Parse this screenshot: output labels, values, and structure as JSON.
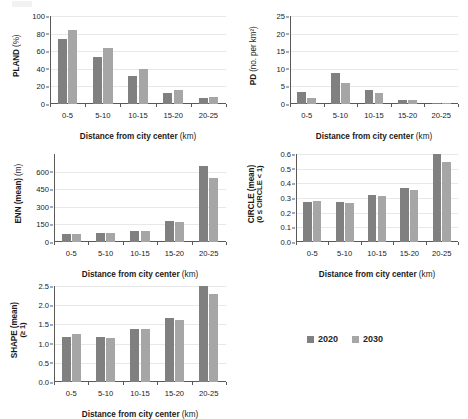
{
  "figure": {
    "xlabel_text": "Distance from city center",
    "xlabel_unit": "(km)",
    "categories": [
      "0-5",
      "5-10",
      "10-15",
      "15-20",
      "20-25"
    ]
  },
  "legend": {
    "position": "center-right",
    "items": [
      {
        "label": "2020",
        "color": "#808080"
      },
      {
        "label": "2030",
        "color": "#a6a6a6"
      }
    ]
  },
  "chart_data": [
    {
      "type": "bar",
      "id": "pland",
      "title": "",
      "ylabel": "PLAND",
      "ylabel_unit": "(%)",
      "ylabel_sub": "",
      "xlabel": "Distance from city center (km)",
      "categories": [
        "0-5",
        "5-10",
        "10-15",
        "15-20",
        "20-25"
      ],
      "ylim": [
        0,
        100
      ],
      "yticks": [
        0,
        20,
        40,
        60,
        80,
        100
      ],
      "ytick_labels": [
        "0",
        "20",
        "40",
        "60",
        "80",
        "100"
      ],
      "grid": true,
      "series": [
        {
          "name": "2020",
          "color": "#808080",
          "values": [
            74,
            53.5,
            32,
            12,
            6.5
          ]
        },
        {
          "name": "2030",
          "color": "#a6a6a6",
          "values": [
            84,
            64,
            39.5,
            15.5,
            8.5
          ]
        }
      ]
    },
    {
      "type": "bar",
      "id": "pd",
      "title": "",
      "ylabel": "PD",
      "ylabel_unit": "(no. per km²)",
      "ylabel_sub": "",
      "xlabel": "Distance from city center (km)",
      "categories": [
        "0-5",
        "5-10",
        "10-15",
        "15-20",
        "20-25"
      ],
      "ylim": [
        0,
        25
      ],
      "yticks": [
        0,
        5,
        10,
        15,
        20,
        25
      ],
      "ytick_labels": [
        "0",
        "5",
        "10",
        "15",
        "20",
        "25"
      ],
      "grid": true,
      "series": [
        {
          "name": "2020",
          "color": "#808080",
          "values": [
            3.5,
            8.8,
            4.1,
            1.2,
            0.2
          ]
        },
        {
          "name": "2030",
          "color": "#a6a6a6",
          "values": [
            1.6,
            6.1,
            3.2,
            1.0,
            0.2
          ]
        }
      ]
    },
    {
      "type": "bar",
      "id": "enn",
      "title": "",
      "ylabel": "ENN (mean)",
      "ylabel_unit": "(m)",
      "ylabel_sub": "",
      "xlabel": "Distance from city center (km)",
      "categories": [
        "0-5",
        "5-10",
        "10-15",
        "15-20",
        "20-25"
      ],
      "ylim": [
        0,
        750
      ],
      "yticks": [
        0,
        150,
        300,
        450,
        600
      ],
      "ytick_labels": [
        "0",
        "150",
        "300",
        "450",
        "600"
      ],
      "grid": true,
      "series": [
        {
          "name": "2020",
          "color": "#808080",
          "values": [
            72,
            73,
            90,
            175,
            650
          ]
        },
        {
          "name": "2030",
          "color": "#a6a6a6",
          "values": [
            72,
            73,
            90,
            174,
            545
          ]
        }
      ]
    },
    {
      "type": "bar",
      "id": "circle",
      "title": "",
      "ylabel": "CIRCLE (mean)",
      "ylabel_unit": "",
      "ylabel_sub": "(0 ≤ CIRCLE < 1)",
      "xlabel": "Distance from city center (km)",
      "categories": [
        "0-5",
        "5-10",
        "10-15",
        "15-20",
        "20-25"
      ],
      "ylim": [
        0,
        0.6
      ],
      "yticks": [
        0,
        0.1,
        0.2,
        0.3,
        0.4,
        0.5,
        0.6
      ],
      "ytick_labels": [
        "0.0",
        "0.1",
        "0.2",
        "0.3",
        "0.4",
        "0.5",
        "0.6"
      ],
      "grid": true,
      "series": [
        {
          "name": "2020",
          "color": "#808080",
          "values": [
            0.275,
            0.276,
            0.321,
            0.371,
            0.598
          ]
        },
        {
          "name": "2030",
          "color": "#a6a6a6",
          "values": [
            0.28,
            0.266,
            0.313,
            0.357,
            0.545
          ]
        }
      ]
    },
    {
      "type": "bar",
      "id": "shape",
      "title": "",
      "ylabel": "SHAPE (mean)",
      "ylabel_unit": "",
      "ylabel_sub": "(≥ 1)",
      "xlabel": "Distance from city center (km)",
      "categories": [
        "0-5",
        "5-10",
        "10-15",
        "15-20",
        "20-25"
      ],
      "ylim": [
        0,
        2.5
      ],
      "yticks": [
        0,
        0.5,
        1.0,
        1.5,
        2.0,
        2.5
      ],
      "ytick_labels": [
        "0.0",
        "0.5",
        "1.0",
        "1.5",
        "2.0",
        "2.5"
      ],
      "grid": true,
      "series": [
        {
          "name": "2020",
          "color": "#808080",
          "values": [
            1.18,
            1.18,
            1.38,
            1.67,
            2.5
          ]
        },
        {
          "name": "2030",
          "color": "#a6a6a6",
          "values": [
            1.24,
            1.15,
            1.37,
            1.62,
            2.28
          ]
        }
      ]
    }
  ]
}
